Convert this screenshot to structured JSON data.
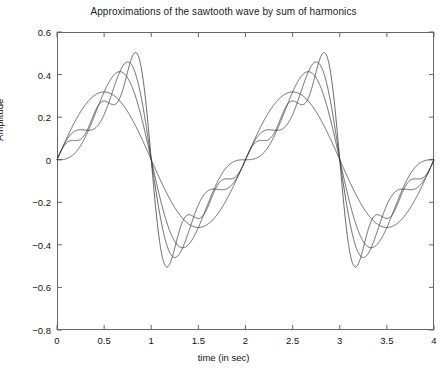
{
  "chart_data": {
    "type": "line",
    "title": "Approximations of the sawtooth wave by sum of harmonics",
    "xlabel": "time (in sec)",
    "ylabel": "Amplitude",
    "xlim": [
      0,
      4
    ],
    "ylim": [
      -0.8,
      0.6
    ],
    "xticks": [
      0,
      0.5,
      1,
      1.5,
      2,
      2.5,
      3,
      3.5,
      4
    ],
    "xtick_labels": [
      "0",
      "0.5",
      "1",
      "1.5",
      "2",
      "2.5",
      "3",
      "3.5",
      "4"
    ],
    "yticks": [
      -0.8,
      -0.6,
      -0.4,
      -0.2,
      0,
      0.2,
      0.4,
      0.6
    ],
    "ytick_labels": [
      "-0.8",
      "-0.6",
      "-0.4",
      "-0.2",
      "0",
      "0.2",
      "0.4",
      "0.6"
    ],
    "grid": false,
    "legend": false,
    "line_color": "#3a3a3a",
    "axis_color": "#666666",
    "period_sec": 2,
    "amplitude": 0.5,
    "waveform": "sawtooth",
    "series": [
      {
        "name": "1 harmonic",
        "harmonics": 1
      },
      {
        "name": "2 harmonics",
        "harmonics": 2
      },
      {
        "name": "3 harmonics",
        "harmonics": 3
      },
      {
        "name": "5 harmonics",
        "harmonics": 5
      }
    ]
  }
}
